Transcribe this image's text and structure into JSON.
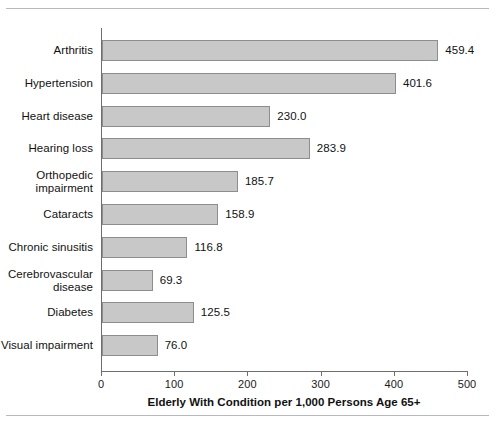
{
  "chart_data": {
    "type": "bar",
    "orientation": "horizontal",
    "title": "",
    "xlabel": "Elderly With Condition per 1,000 Persons Age 65+",
    "ylabel": "",
    "xlim": [
      0,
      500
    ],
    "xticks": [
      0,
      100,
      200,
      300,
      400,
      500
    ],
    "xtick_labels": [
      "0",
      "100",
      "200",
      "300",
      "400",
      "500"
    ],
    "grid": false,
    "legend": false,
    "categories": [
      "Arthritis",
      "Hypertension",
      "Heart disease",
      "Hearing loss",
      "Orthopedic impairment",
      "Cataracts",
      "Chronic sinusitis",
      "Cerebrovascular disease",
      "Diabetes",
      "Visual impairment"
    ],
    "values": [
      459.4,
      401.6,
      230.0,
      283.9,
      185.7,
      158.9,
      116.8,
      69.3,
      125.5,
      76.0
    ],
    "value_labels": [
      "459.4",
      "401.6",
      "230.0",
      "283.9",
      "185.7",
      "158.9",
      "116.8",
      "69.3",
      "125.5",
      "76.0"
    ],
    "category_label_lines": [
      [
        "Arthritis"
      ],
      [
        "Hypertension"
      ],
      [
        "Heart disease"
      ],
      [
        "Hearing loss"
      ],
      [
        "Orthopedic",
        "impairment"
      ],
      [
        "Cataracts"
      ],
      [
        "Chronic sinusitis"
      ],
      [
        "Cerebrovascular",
        "disease"
      ],
      [
        "Diabetes"
      ],
      [
        "Visual impairment"
      ]
    ],
    "colors": {
      "bar_fill": "#c8c8c8",
      "bar_border": "#8d8d8d",
      "axis": "#6e6e6e",
      "text": "#111111",
      "rule": "#b9b9bd",
      "background": "#ffffff"
    }
  }
}
